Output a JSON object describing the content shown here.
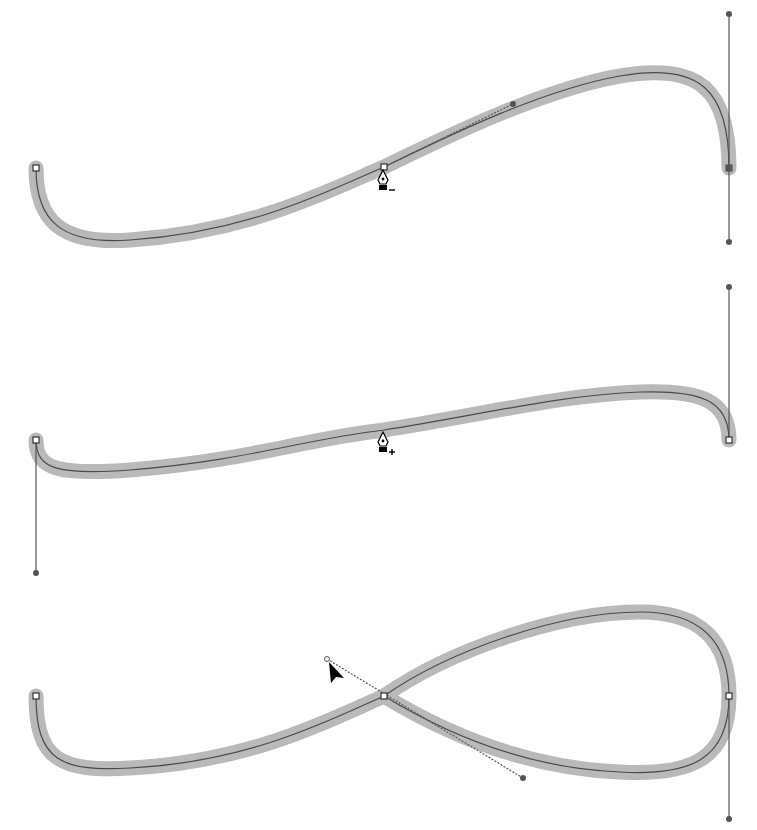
{
  "caption": {
    "text": "",
    "note": "cropped text at top, illegible"
  },
  "colors": {
    "stroke_highlight": "#b9b9b9",
    "path_line": "#4a4a4a",
    "handle": "#555555",
    "anchor_fill": "#ffffff",
    "background": "#ffffff"
  },
  "figures": [
    {
      "name": "delete-anchor-step",
      "cursor": {
        "type": "pen-minus-icon",
        "label": "−",
        "x": 383,
        "y": 178
      },
      "path": "M36,168 C36,220 60,245 130,240 C250,232 330,190 384,167 C440,140 540,90 620,76 C700,62 729,90 729,168",
      "anchors": [
        {
          "x": 36,
          "y": 168,
          "selected": false
        },
        {
          "x": 384,
          "y": 167,
          "selected": false
        },
        {
          "x": 729,
          "y": 168,
          "selected": true
        }
      ],
      "handles": [
        {
          "x1": 384,
          "y1": 167,
          "x2": 513,
          "y2": 104,
          "dotted": true
        },
        {
          "x1": 729,
          "y1": 14,
          "x2": 729,
          "y2": 242,
          "dotted": false
        }
      ]
    },
    {
      "name": "add-anchor-step",
      "cursor": {
        "type": "pen-plus-icon",
        "label": "+",
        "x": 383,
        "y": 448
      },
      "path": "M36,440 C36,470 60,475 130,470 C250,460 300,440 384,430 C480,415 560,395 640,392 C700,390 729,400 729,440",
      "anchors": [
        {
          "x": 36,
          "y": 440,
          "selected": false
        },
        {
          "x": 729,
          "y": 440,
          "selected": false
        }
      ],
      "handles": [
        {
          "x1": 36,
          "y1": 440,
          "x2": 36,
          "y2": 573,
          "dotted": false
        },
        {
          "x1": 729,
          "y1": 440,
          "x2": 729,
          "y2": 287,
          "dotted": false
        }
      ]
    },
    {
      "name": "convert-point-step",
      "cursor": {
        "type": "arrow-cursor-icon",
        "x": 330,
        "y": 660
      },
      "path": "M36,696 C36,760 60,772 130,768 C250,762 330,720 384,696 C450,650 560,612 640,612 C700,612 729,640 729,696 C729,760 690,776 620,772 C520,768 440,730 384,696",
      "anchors": [
        {
          "x": 36,
          "y": 696,
          "selected": false
        },
        {
          "x": 384,
          "y": 696,
          "selected": false
        },
        {
          "x": 729,
          "y": 696,
          "selected": false
        }
      ],
      "handles": [
        {
          "x1": 327,
          "y1": 659,
          "x2": 523,
          "y2": 778,
          "dotted": true
        },
        {
          "x1": 729,
          "y1": 696,
          "x2": 729,
          "y2": 819,
          "dotted": false
        }
      ]
    }
  ]
}
